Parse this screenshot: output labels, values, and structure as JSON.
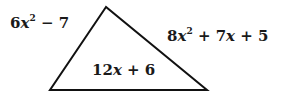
{
  "diagram": {
    "type": "triangle",
    "stroke_color": "#111111",
    "fill_color": "#ffffff",
    "vertices": [
      [
        106,
        7
      ],
      [
        50,
        90
      ],
      [
        207,
        90
      ]
    ],
    "sides": {
      "left": {
        "label": "6x² − 7",
        "coefficient": "6",
        "variable": "x",
        "exponent": "2",
        "rest": " − 7"
      },
      "right": {
        "label": "8x² + 7x + 5",
        "coefficient": "8",
        "variable": "x",
        "exponent": "2",
        "rest_a": " + 7",
        "variable2": "x",
        "rest_b": " + 5"
      },
      "bottom": {
        "label": "12x + 6",
        "coefficient": "12",
        "variable": "x",
        "rest": " + 6"
      }
    }
  }
}
